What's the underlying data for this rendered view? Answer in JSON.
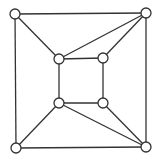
{
  "diagram": {
    "type": "graph",
    "colors": {
      "stroke": "#333333",
      "node_fill": "#ffffff",
      "background": "#ffffff"
    },
    "node_radius": 5,
    "nodes": [
      {
        "id": "outer-tl",
        "x": 15,
        "y": 14
      },
      {
        "id": "outer-tr",
        "x": 146,
        "y": 13
      },
      {
        "id": "outer-bl",
        "x": 16,
        "y": 148
      },
      {
        "id": "outer-br",
        "x": 146,
        "y": 147
      },
      {
        "id": "inner-tl",
        "x": 59,
        "y": 59
      },
      {
        "id": "inner-tr",
        "x": 103,
        "y": 58
      },
      {
        "id": "inner-bl",
        "x": 59,
        "y": 103
      },
      {
        "id": "inner-br",
        "x": 103,
        "y": 103
      }
    ],
    "edges": [
      [
        "outer-tl",
        "outer-tr"
      ],
      [
        "outer-tl",
        "outer-bl"
      ],
      [
        "outer-tr",
        "outer-br"
      ],
      [
        "outer-bl",
        "outer-br"
      ],
      [
        "inner-tl",
        "inner-tr"
      ],
      [
        "inner-tl",
        "inner-bl"
      ],
      [
        "inner-tr",
        "inner-br"
      ],
      [
        "inner-bl",
        "inner-br"
      ],
      [
        "outer-tl",
        "inner-tl"
      ],
      [
        "outer-tr",
        "inner-tl"
      ],
      [
        "outer-tr",
        "inner-tr"
      ],
      [
        "outer-bl",
        "inner-bl"
      ],
      [
        "outer-br",
        "inner-bl"
      ],
      [
        "outer-br",
        "inner-br"
      ]
    ]
  }
}
